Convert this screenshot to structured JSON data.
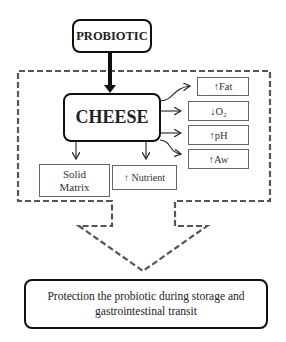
{
  "diagram": {
    "source_node": {
      "label": "PROBIOTIC"
    },
    "carrier_node": {
      "label": "CHEESE"
    },
    "properties": [
      {
        "label": "↑Fat"
      },
      {
        "label": "↓O₂"
      },
      {
        "label": "↑pH"
      },
      {
        "label": "↑Aw"
      }
    ],
    "bottom_effects": [
      {
        "label_line1": "Solid",
        "label_line2": "Matrix"
      },
      {
        "label": "↑ Nutrient"
      }
    ],
    "outcome": {
      "label_line1": "Protection the probiotic during storage and",
      "label_line2": "gastrointestinal transit"
    },
    "colors": {
      "stroke": "#111111",
      "dashed": "#555555",
      "thin_border": "#666666",
      "background": "#ffffff"
    }
  }
}
